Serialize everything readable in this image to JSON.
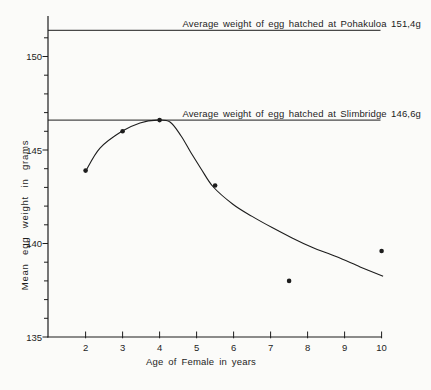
{
  "figure": {
    "background": "#fbfbf9",
    "ink_color": "#1d1d1d"
  },
  "chart_data": {
    "type": "scatter",
    "title": "",
    "xlabel": "Age of Female in years",
    "ylabel": "Mean egg weight in grams",
    "xlim": [
      1,
      10.1
    ],
    "ylim": [
      135,
      152.2
    ],
    "grid": "off",
    "legend": "none",
    "x_ticks": [
      2,
      3,
      4,
      5,
      6,
      7,
      8,
      9,
      10
    ],
    "y_major_ticks": [
      135,
      140,
      145,
      150
    ],
    "y_minor_ticks_every": 1,
    "y_minor_tick_range": [
      135,
      151
    ],
    "points": {
      "ages": [
        2,
        3,
        4,
        5.5,
        7.5,
        10
      ],
      "mean_egg_weight_g": [
        143.9,
        146.0,
        146.6,
        143.1,
        138.0,
        139.6
      ]
    },
    "fitted_curve_age_weight": [
      [
        2.01,
        143.9
      ],
      [
        2.39,
        145.1
      ],
      [
        2.98,
        146.0
      ],
      [
        3.47,
        146.45
      ],
      [
        3.93,
        146.6
      ],
      [
        4.28,
        146.5
      ],
      [
        4.58,
        145.75
      ],
      [
        4.85,
        144.85
      ],
      [
        5.12,
        144.0
      ],
      [
        5.44,
        143.05
      ],
      [
        5.98,
        142.1
      ],
      [
        6.5,
        141.45
      ],
      [
        7.04,
        140.85
      ],
      [
        7.58,
        140.3
      ],
      [
        8.12,
        139.8
      ],
      [
        8.77,
        139.3
      ],
      [
        9.42,
        138.75
      ],
      [
        10.04,
        138.25
      ]
    ],
    "reference_lines": [
      {
        "name": "Pohakuloa",
        "label": "Average weight of egg hatched at Pohakuloa 151,4g",
        "value_g": 151.4
      },
      {
        "name": "Slimbridge",
        "label": "Average weight of egg hatched at Slimbridge 146,6g",
        "value_g": 146.6
      }
    ]
  }
}
